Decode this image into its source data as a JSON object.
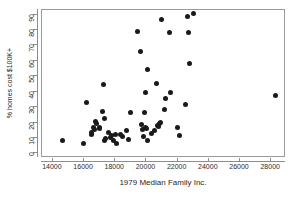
{
  "chart_data": {
    "type": "scatter",
    "title": "",
    "xlabel": "1979 Median Family Inc.",
    "ylabel": "% homes cost $100K+",
    "xlim": [
      13300,
      28950
    ],
    "ylim": [
      -3,
      93
    ],
    "xticks": [
      14000,
      16000,
      18000,
      20000,
      22000,
      24000,
      26000,
      28000
    ],
    "xticklabels": [
      "14000",
      "16000",
      "18000",
      "20000",
      "22000",
      "24000",
      "26000",
      "28000"
    ],
    "yticks": [
      0,
      10,
      20,
      30,
      40,
      50,
      60,
      70,
      80,
      90
    ],
    "yticklabels": [
      "0",
      "10",
      "20",
      "30",
      "40",
      "50",
      "60",
      "70",
      "80",
      "90"
    ],
    "grid": false,
    "legend": false,
    "marker": "filled-circle",
    "marker_color": "#1a1a1a",
    "points": [
      [
        14620,
        7.5
      ],
      [
        15980,
        5.0
      ],
      [
        16210,
        32.0
      ],
      [
        16480,
        11.0
      ],
      [
        16520,
        12.5
      ],
      [
        16600,
        15.5
      ],
      [
        16680,
        14.5
      ],
      [
        16760,
        20.0
      ],
      [
        16850,
        18.5
      ],
      [
        17000,
        15.0
      ],
      [
        17050,
        15.5
      ],
      [
        17200,
        26.5
      ],
      [
        17250,
        44.0
      ],
      [
        17320,
        21.5
      ],
      [
        17340,
        7.5
      ],
      [
        17400,
        8.5
      ],
      [
        17600,
        12.5
      ],
      [
        17700,
        9.0
      ],
      [
        17820,
        10.5
      ],
      [
        17900,
        7.5
      ],
      [
        18080,
        11.0
      ],
      [
        18150,
        5.5
      ],
      [
        18400,
        11.0
      ],
      [
        18500,
        9.5
      ],
      [
        18750,
        14.0
      ],
      [
        18900,
        8.0
      ],
      [
        19050,
        25.5
      ],
      [
        19450,
        79.0
      ],
      [
        19700,
        65.5
      ],
      [
        19720,
        17.5
      ],
      [
        19780,
        14.5
      ],
      [
        19850,
        9.5
      ],
      [
        19900,
        25.5
      ],
      [
        19980,
        39.0
      ],
      [
        20020,
        16.0
      ],
      [
        20060,
        15.0
      ],
      [
        20100,
        7.0
      ],
      [
        20150,
        54.0
      ],
      [
        20350,
        12.0
      ],
      [
        20600,
        14.0
      ],
      [
        20700,
        44.5
      ],
      [
        20780,
        17.0
      ],
      [
        20820,
        16.5
      ],
      [
        20900,
        18.5
      ],
      [
        20950,
        19.0
      ],
      [
        21050,
        86.5
      ],
      [
        21200,
        27.5
      ],
      [
        21300,
        34.5
      ],
      [
        21550,
        78.5
      ],
      [
        21600,
        38.5
      ],
      [
        22050,
        16.0
      ],
      [
        22200,
        10.5
      ],
      [
        22550,
        31.0
      ],
      [
        22720,
        88.5
      ],
      [
        22800,
        78.5
      ],
      [
        22850,
        57.5
      ],
      [
        23120,
        90.5
      ],
      [
        28400,
        37.0
      ]
    ]
  }
}
